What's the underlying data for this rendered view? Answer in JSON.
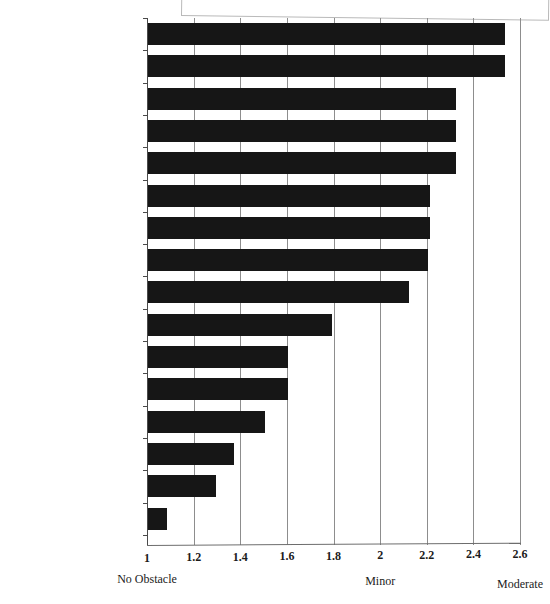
{
  "chart_data": {
    "type": "bar",
    "orientation": "horizontal",
    "title": "",
    "xlabel": "",
    "ylabel": "",
    "xlim": [
      1,
      2.6
    ],
    "grid": true,
    "legend": "none",
    "bar_color": "#161616",
    "xticks": [
      "1",
      "1.2",
      "1.4",
      "1.6",
      "1.8",
      "2",
      "2.2",
      "2.4",
      "2.6"
    ],
    "xtick_values": [
      1,
      1.2,
      1.4,
      1.6,
      1.8,
      2,
      2.2,
      2.4,
      2.6
    ],
    "scale_anchors": [
      {
        "label": "No Obstacle",
        "value": 1
      },
      {
        "label": "Minor",
        "value": 2
      },
      {
        "label": "Moderate",
        "value": 2.6
      }
    ],
    "categories": [
      "Inflation/ Price Instability",
      "Political Uncertainty",
      "Exchange Rate",
      "Policy Uncertainty",
      "Problems of Security",
      "Infrastructure",
      "Human Resources",
      "Finance",
      "High Level of Taxes",
      "Regulations",
      "Production and Technology",
      "Sales",
      "Functioning of Judicial System",
      "Acquiring Inputs",
      "Professional Services",
      "Quality/ Capacity Airports/Ports"
    ],
    "values": [
      2.53,
      2.53,
      2.32,
      2.32,
      2.32,
      2.21,
      2.21,
      2.2,
      2.12,
      1.79,
      1.6,
      1.6,
      1.5,
      1.37,
      1.29,
      1.08
    ]
  }
}
